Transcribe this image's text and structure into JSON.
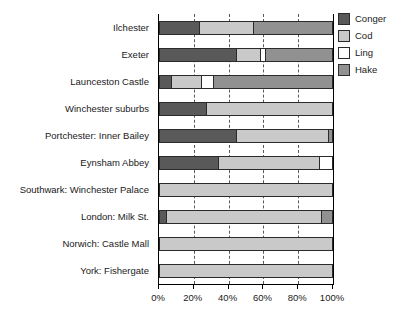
{
  "chart_data": {
    "type": "bar",
    "orientation": "horizontal",
    "stacked": true,
    "normalized_percent": true,
    "title": "",
    "subtitle": "",
    "xlabel": "",
    "ylabel": "",
    "xlim": [
      0,
      100
    ],
    "xticks": [
      0,
      20,
      40,
      60,
      80,
      100
    ],
    "xticklabels": [
      "0%",
      "20%",
      "40%",
      "60%",
      "80%",
      "100%"
    ],
    "grid": "vertical-dashed",
    "legend_position": "right",
    "categories": [
      "Ilchester",
      "Exeter",
      "Launceston Castle",
      "Winchester suburbs",
      "Portchester: Inner Bailey",
      "Eynsham Abbey",
      "Southwark: Winchester Palace",
      "London: Milk St.",
      "Norwich: Castle Mall",
      "York: Fishergate"
    ],
    "series": [
      {
        "name": "Conger",
        "color": "#595959",
        "values": [
          23,
          44,
          7,
          27,
          44,
          34,
          0,
          4,
          0,
          0
        ]
      },
      {
        "name": "Cod",
        "color": "#c9c9c9",
        "values": [
          31,
          14,
          17,
          73,
          53,
          58,
          100,
          89,
          100,
          100
        ]
      },
      {
        "name": "Ling",
        "color": "#ffffff",
        "values": [
          0,
          3,
          7,
          0,
          0,
          8,
          0,
          0,
          0,
          0
        ]
      },
      {
        "name": "Hake",
        "color": "#919191",
        "values": [
          46,
          39,
          69,
          0,
          3,
          0,
          0,
          7,
          0,
          0
        ]
      }
    ]
  },
  "legend": {
    "items": [
      {
        "label": "Conger",
        "color": "#595959"
      },
      {
        "label": "Cod",
        "color": "#c9c9c9"
      },
      {
        "label": "Ling",
        "color": "#ffffff"
      },
      {
        "label": "Hake",
        "color": "#919191"
      }
    ]
  }
}
